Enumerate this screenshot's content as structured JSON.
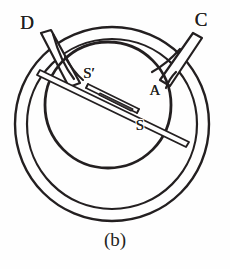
{
  "figure": {
    "caption": "(b)",
    "caption_x": 115,
    "caption_y": 243,
    "width": 230,
    "height": 269,
    "background_color": "#fefefe",
    "ink_color": "#231f20",
    "needle_fill_color": "#4a4646",
    "labels": [
      {
        "id": "terminal-d",
        "text": "D",
        "x": 27,
        "y": 29,
        "size": 19,
        "italic": false
      },
      {
        "id": "terminal-c",
        "text": "C",
        "x": 201,
        "y": 26,
        "size": 19,
        "italic": false
      },
      {
        "id": "pivot-s-prime",
        "text": "S′",
        "x": 89,
        "y": 78,
        "size": 15,
        "italic": false
      },
      {
        "id": "chamber-a",
        "text": "A",
        "x": 155,
        "y": 95,
        "size": 15,
        "italic": false
      },
      {
        "id": "needle-s",
        "text": "S",
        "x": 140,
        "y": 130,
        "size": 15,
        "italic": false
      }
    ],
    "parts": {
      "outer_ring_label": "outer coil ring",
      "inner_circle_label": "compass chamber",
      "needle_label": "magnetic needle",
      "tube_d_label": "lead tube D",
      "tube_c_label": "lead tube C"
    },
    "geometry": {
      "ring_center_x": 112,
      "ring_center_y": 124,
      "ring_outer_radius": 97,
      "ring_inner_radius": 85,
      "chamber_center_x": 108,
      "chamber_center_y": 105,
      "chamber_radius": 63,
      "needle_angle_deg": 28
    }
  }
}
